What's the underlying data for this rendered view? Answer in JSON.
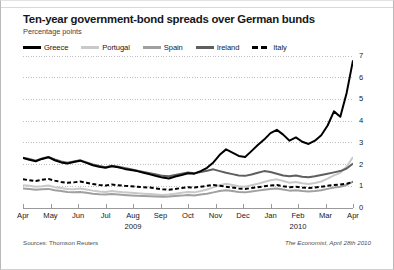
{
  "figure": {
    "title": "Ten-year government-bond spreads over German bunds",
    "subtitle": "Percentage points",
    "source": "Sources: Thomson Reuters",
    "credit": "The Economist, April 28th 2010"
  },
  "colors": {
    "greece": "#000000",
    "portugal": "#c9c9c9",
    "spain": "#a0a0a0",
    "ireland": "#5f5f5f",
    "italy": "#000000",
    "gridline": "#b0b0b0",
    "axis": "#9a9a9a",
    "text": "#15181a"
  },
  "chart_data": {
    "type": "line",
    "title": "Ten-year government-bond spreads over German bunds",
    "subtitle": "Percentage points",
    "xlabel": "",
    "ylabel": "Percentage points",
    "ylim": [
      0,
      7
    ],
    "yticks": [
      0,
      1,
      2,
      3,
      4,
      5,
      6,
      7
    ],
    "ytick_labels": [
      "0",
      "1",
      "2",
      "3",
      "4",
      "5",
      "6",
      "7"
    ],
    "y_axis_position": "right",
    "grid": true,
    "grid_style": "dotted-horizontal",
    "legend_position": "top-left",
    "x_categories": [
      "Apr",
      "May",
      "Jun",
      "Jul",
      "Aug",
      "Sep",
      "Oct",
      "Nov",
      "Dec",
      "Jan",
      "Feb",
      "Mar",
      "Apr"
    ],
    "x_year_labels": [
      {
        "label": "2009",
        "at_month": "Aug"
      },
      {
        "label": "2010",
        "at_month": "Feb"
      }
    ],
    "x_range_description": "April 2009 to April 2010, weekly observations",
    "n_points": 53,
    "series": [
      {
        "name": "Greece",
        "color": "#000000",
        "style": "solid",
        "width": 2.0,
        "values": [
          2.3,
          2.22,
          2.15,
          2.26,
          2.34,
          2.2,
          2.1,
          2.05,
          2.12,
          2.18,
          2.08,
          1.97,
          1.9,
          1.85,
          1.92,
          1.88,
          1.8,
          1.75,
          1.7,
          1.62,
          1.55,
          1.47,
          1.4,
          1.36,
          1.45,
          1.52,
          1.6,
          1.58,
          1.7,
          1.85,
          2.1,
          2.45,
          2.7,
          2.55,
          2.4,
          2.35,
          2.62,
          2.9,
          3.15,
          3.45,
          3.6,
          3.38,
          3.1,
          3.25,
          3.05,
          2.95,
          3.1,
          3.35,
          3.8,
          4.45,
          4.2,
          5.3,
          6.8
        ]
      },
      {
        "name": "Portugal",
        "color": "#c9c9c9",
        "style": "solid",
        "width": 2.0,
        "values": [
          1.05,
          1.02,
          0.98,
          1.0,
          1.04,
          0.96,
          0.92,
          0.88,
          0.86,
          0.9,
          0.85,
          0.8,
          0.76,
          0.74,
          0.78,
          0.75,
          0.72,
          0.7,
          0.68,
          0.66,
          0.64,
          0.62,
          0.6,
          0.62,
          0.66,
          0.7,
          0.74,
          0.72,
          0.78,
          0.85,
          0.95,
          1.05,
          1.12,
          1.06,
          1.0,
          0.98,
          1.05,
          1.12,
          1.2,
          1.28,
          1.32,
          1.24,
          1.16,
          1.2,
          1.14,
          1.1,
          1.15,
          1.22,
          1.35,
          1.5,
          1.62,
          1.9,
          2.35
        ]
      },
      {
        "name": "Spain",
        "color": "#a0a0a0",
        "style": "solid",
        "width": 2.0,
        "values": [
          0.9,
          0.88,
          0.84,
          0.86,
          0.88,
          0.82,
          0.78,
          0.74,
          0.72,
          0.74,
          0.7,
          0.66,
          0.63,
          0.62,
          0.64,
          0.62,
          0.6,
          0.58,
          0.56,
          0.55,
          0.54,
          0.53,
          0.52,
          0.53,
          0.55,
          0.57,
          0.6,
          0.58,
          0.62,
          0.66,
          0.72,
          0.78,
          0.82,
          0.78,
          0.74,
          0.72,
          0.76,
          0.8,
          0.84,
          0.88,
          0.9,
          0.85,
          0.8,
          0.82,
          0.78,
          0.76,
          0.78,
          0.82,
          0.88,
          0.94,
          0.98,
          1.06,
          1.22
        ]
      },
      {
        "name": "Ireland",
        "color": "#5f5f5f",
        "style": "solid",
        "width": 2.0,
        "values": [
          2.32,
          2.26,
          2.18,
          2.28,
          2.35,
          2.24,
          2.14,
          2.08,
          2.14,
          2.2,
          2.1,
          2.0,
          1.94,
          1.88,
          1.95,
          1.9,
          1.84,
          1.78,
          1.72,
          1.66,
          1.6,
          1.54,
          1.48,
          1.46,
          1.52,
          1.58,
          1.64,
          1.6,
          1.66,
          1.72,
          1.78,
          1.7,
          1.62,
          1.56,
          1.5,
          1.48,
          1.54,
          1.62,
          1.7,
          1.66,
          1.58,
          1.5,
          1.46,
          1.5,
          1.44,
          1.42,
          1.46,
          1.52,
          1.58,
          1.64,
          1.7,
          1.82,
          2.05
        ]
      },
      {
        "name": "Italy",
        "color": "#000000",
        "style": "dashed",
        "width": 2.0,
        "values": [
          1.32,
          1.28,
          1.24,
          1.3,
          1.34,
          1.26,
          1.2,
          1.16,
          1.18,
          1.22,
          1.16,
          1.1,
          1.06,
          1.04,
          1.08,
          1.05,
          1.02,
          1.0,
          0.98,
          0.96,
          0.94,
          0.9,
          0.86,
          0.84,
          0.88,
          0.92,
          0.96,
          0.94,
          0.98,
          1.02,
          1.06,
          1.02,
          0.98,
          0.94,
          0.9,
          0.88,
          0.92,
          0.96,
          1.0,
          1.04,
          1.06,
          1.0,
          0.96,
          0.98,
          0.94,
          0.92,
          0.94,
          0.98,
          1.02,
          1.06,
          1.08,
          1.12,
          1.2
        ]
      }
    ]
  }
}
